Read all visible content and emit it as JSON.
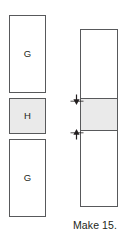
{
  "diagram": {
    "kind": "quilting-strip-set-assembly",
    "pieces": [
      {
        "id": "g-top",
        "label": "G",
        "fill": "#ffffff",
        "stroke": "#58595b"
      },
      {
        "id": "h-middle",
        "label": "H",
        "fill": "#eaeaea",
        "stroke": "#58595b"
      },
      {
        "id": "g-bottom",
        "label": "G",
        "fill": "#ffffff",
        "stroke": "#58595b"
      }
    ],
    "strip_set": {
      "segments": [
        {
          "id": "g-top",
          "label": "G",
          "fill": "#ffffff"
        },
        {
          "id": "h-middle",
          "label": "H",
          "fill": "#eaeaea"
        },
        {
          "id": "g-bottom",
          "label": "G",
          "fill": "#ffffff"
        }
      ]
    },
    "measure": {
      "icon_top": "arrow-down-icon",
      "icon_bottom": "arrow-up-icon",
      "stroke": "#231f20"
    },
    "caption": "Make 15."
  }
}
